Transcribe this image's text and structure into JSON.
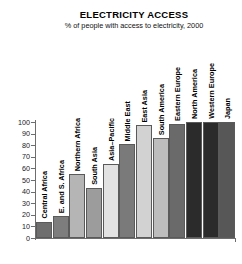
{
  "chart_data": {
    "type": "bar",
    "title": "ELECTRICITY ACCESS",
    "subtitle": "% of people with access to electricity, 2000",
    "xlabel": "",
    "ylabel": "",
    "ylim": [
      0,
      100
    ],
    "yticks": [
      0,
      10,
      20,
      30,
      40,
      50,
      60,
      70,
      80,
      90,
      100
    ],
    "grid": false,
    "legend": "none",
    "categories": [
      "Central Africa",
      "E. and S. Africa",
      "Northern Africa",
      "South Asia",
      "Asia–Pacific",
      "Middle East",
      "East Asia",
      "South America",
      "Eastern Europe",
      "North America",
      "Western Europe",
      "Japan"
    ],
    "values": [
      14,
      19,
      55,
      43,
      64,
      81,
      97,
      86,
      98,
      100,
      100,
      100
    ],
    "bar_colors": [
      "#6e6e6e",
      "#7d7d7d",
      "#b5b5b5",
      "#9c9c9c",
      "#e2e2e2",
      "#7a7a7a",
      "#d2d2d2",
      "#bdbdbd",
      "#6a6a6a",
      "#2b2b2b",
      "#2b2b2b",
      "#575757"
    ]
  },
  "axis": {
    "line_color": "#6d6d6d"
  }
}
